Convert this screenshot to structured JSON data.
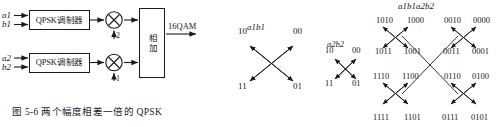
{
  "figure": {
    "caption": "图 5-6   两个幅度相差一倍的 QPSK",
    "caption_number": "图 5-6",
    "caption_text": "两个幅度相差一倍的 QPSK"
  },
  "block_diagram": {
    "inputs": [
      {
        "label": "a1"
      },
      {
        "label": "b1"
      },
      {
        "label": "a2"
      },
      {
        "label": "b2"
      }
    ],
    "modulators": [
      {
        "label": "QPSK调制器"
      },
      {
        "label": "QPSK调制器"
      }
    ],
    "multipliers": [
      {
        "symbol": "×",
        "gain": "2"
      },
      {
        "symbol": "×",
        "gain": "1"
      }
    ],
    "adder": {
      "label": "相加"
    },
    "output": {
      "label": "16QAM"
    }
  },
  "constellations": [
    {
      "title": "a1b1",
      "points": [
        {
          "label": "10",
          "quadrant": "top-left"
        },
        {
          "label": "00",
          "quadrant": "top-right"
        },
        {
          "label": "11",
          "quadrant": "bottom-left"
        },
        {
          "label": "01",
          "quadrant": "bottom-right"
        }
      ]
    },
    {
      "title": "a2b2",
      "points": [
        {
          "label": "10",
          "quadrant": "top-left"
        },
        {
          "label": "00",
          "quadrant": "top-right"
        },
        {
          "label": "11",
          "quadrant": "bottom-left"
        },
        {
          "label": "01",
          "quadrant": "bottom-right"
        }
      ]
    },
    {
      "title": "a1b1a2b2",
      "points": [
        {
          "label": "1010",
          "row": 0,
          "col": 0
        },
        {
          "label": "1000",
          "row": 0,
          "col": 1
        },
        {
          "label": "0010",
          "row": 0,
          "col": 2
        },
        {
          "label": "0000",
          "row": 0,
          "col": 3
        },
        {
          "label": "1011",
          "row": 1,
          "col": 0
        },
        {
          "label": "1001",
          "row": 1,
          "col": 1
        },
        {
          "label": "0011",
          "row": 1,
          "col": 2
        },
        {
          "label": "0001",
          "row": 1,
          "col": 3
        },
        {
          "label": "1110",
          "row": 2,
          "col": 0
        },
        {
          "label": "1100",
          "row": 2,
          "col": 1
        },
        {
          "label": "0110",
          "row": 2,
          "col": 2
        },
        {
          "label": "0100",
          "row": 2,
          "col": 3
        },
        {
          "label": "1111",
          "row": 3,
          "col": 0
        },
        {
          "label": "1101",
          "row": 3,
          "col": 1
        },
        {
          "label": "0111",
          "row": 3,
          "col": 2
        },
        {
          "label": "0101",
          "row": 3,
          "col": 3
        }
      ]
    }
  ],
  "colors": {
    "ink": "#1a1a1a",
    "background": "#ffffff"
  }
}
